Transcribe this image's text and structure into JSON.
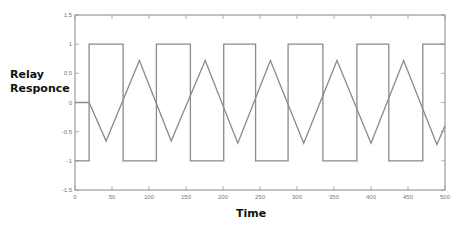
{
  "chart_data": {
    "type": "line",
    "title": "",
    "xlabel": "Time",
    "ylabel": "Relay Responce",
    "xlim": [
      0,
      500
    ],
    "ylim": [
      -1.5,
      1.5
    ],
    "xticks": [
      0,
      50,
      100,
      150,
      200,
      250,
      300,
      350,
      400,
      450,
      500
    ],
    "yticks": [
      -1.5,
      -1,
      -0.5,
      0,
      0.5,
      1,
      1.5
    ],
    "ytick_labels": [
      "-1.5",
      "-1",
      "-0.5",
      "0",
      "0.5",
      "1",
      "1.5"
    ],
    "grid": false,
    "legend": null,
    "series": [
      {
        "name": "Relay output (square)",
        "points": [
          [
            0,
            -1
          ],
          [
            19,
            -1
          ],
          [
            19,
            1
          ],
          [
            65,
            1
          ],
          [
            65,
            -1
          ],
          [
            110,
            -1
          ],
          [
            110,
            1
          ],
          [
            156,
            1
          ],
          [
            156,
            -1
          ],
          [
            201,
            -1
          ],
          [
            201,
            1
          ],
          [
            244,
            1
          ],
          [
            244,
            -1
          ],
          [
            288,
            -1
          ],
          [
            288,
            1
          ],
          [
            335,
            1
          ],
          [
            335,
            -1
          ],
          [
            381,
            -1
          ],
          [
            381,
            1
          ],
          [
            424,
            1
          ],
          [
            424,
            -1
          ],
          [
            470,
            -1
          ],
          [
            470,
            1
          ],
          [
            500,
            1
          ]
        ]
      },
      {
        "name": "Process response (triangle)",
        "points": [
          [
            0,
            0
          ],
          [
            19,
            0
          ],
          [
            42,
            -0.66
          ],
          [
            87,
            0.72
          ],
          [
            130,
            -0.66
          ],
          [
            176,
            0.72
          ],
          [
            220,
            -0.7
          ],
          [
            264,
            0.72
          ],
          [
            309,
            -0.7
          ],
          [
            354,
            0.72
          ],
          [
            400,
            -0.7
          ],
          [
            444,
            0.72
          ],
          [
            489,
            -0.72
          ],
          [
            500,
            -0.4
          ]
        ]
      }
    ],
    "line_color": "#8a8a8a",
    "axis_color": "#9a9a9a"
  }
}
